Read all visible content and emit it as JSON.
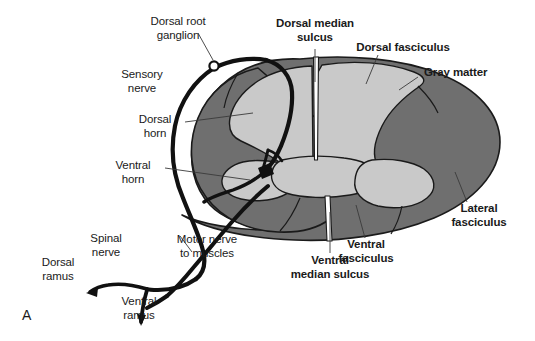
{
  "figure": {
    "panel_letter": "A",
    "title_implied": "Spinal cord cross section with spinal nerve",
    "background_color": "#ffffff",
    "ink_color": "#1a1a1a"
  },
  "colors": {
    "gray_matter_fill": "#c9c9c9",
    "white_matter_fill": "#6f6f6f",
    "outline": "#1a1a1a",
    "nerve_stroke": "#111111",
    "leader_line": "#3a3a3a",
    "white": "#ffffff"
  },
  "labels": {
    "dorsal_root_ganglion": {
      "text": "Dorsal root\nganglion",
      "weight": "regular",
      "align": "center"
    },
    "sensory_nerve": {
      "text": "Sensory\nnerve",
      "weight": "regular",
      "align": "center"
    },
    "dorsal_horn": {
      "text": "Dorsal\nhorn",
      "weight": "regular",
      "align": "center"
    },
    "ventral_horn": {
      "text": "Ventral\nhorn",
      "weight": "regular",
      "align": "center"
    },
    "spinal_nerve": {
      "text": "Spinal\nnerve",
      "weight": "regular",
      "align": "center"
    },
    "dorsal_ramus": {
      "text": "Dorsal\nramus",
      "weight": "regular",
      "align": "center"
    },
    "ventral_ramus": {
      "text": "Ventral\nramus",
      "weight": "regular",
      "align": "center"
    },
    "motor_nerve_to_muscles": {
      "text": "Motor nerve\nto muscles",
      "weight": "regular",
      "align": "center"
    },
    "dorsal_median_sulcus": {
      "text": "Dorsal median\nsulcus",
      "weight": "bold",
      "align": "center"
    },
    "dorsal_fasciculus": {
      "text": "Dorsal fasciculus",
      "weight": "bold",
      "align": "center"
    },
    "gray_matter": {
      "text": "Gray matter",
      "weight": "bold",
      "align": "left"
    },
    "lateral_fasciculus": {
      "text": "Lateral\nfasciculus",
      "weight": "bold",
      "align": "center"
    },
    "ventral_fasciculus": {
      "text": "Ventral\nfasciculus",
      "weight": "bold",
      "align": "center"
    },
    "ventral_median_sulcus": {
      "text": "Ventral\nmedian sulcus",
      "weight": "bold",
      "align": "center"
    }
  },
  "structures": [
    {
      "name": "cord-outline",
      "kind": "oval-cross-section"
    },
    {
      "name": "white-matter-fasciculi",
      "kind": "region"
    },
    {
      "name": "gray-matter-butterfly",
      "kind": "region"
    },
    {
      "name": "dorsal-median-sulcus",
      "kind": "cleft"
    },
    {
      "name": "ventral-median-sulcus",
      "kind": "cleft"
    },
    {
      "name": "sensory-nerve-path",
      "kind": "nerve"
    },
    {
      "name": "motor-nerve-path",
      "kind": "nerve"
    },
    {
      "name": "dorsal-root-ganglion",
      "kind": "ganglion"
    },
    {
      "name": "synapse-interneuron",
      "kind": "detail"
    }
  ]
}
